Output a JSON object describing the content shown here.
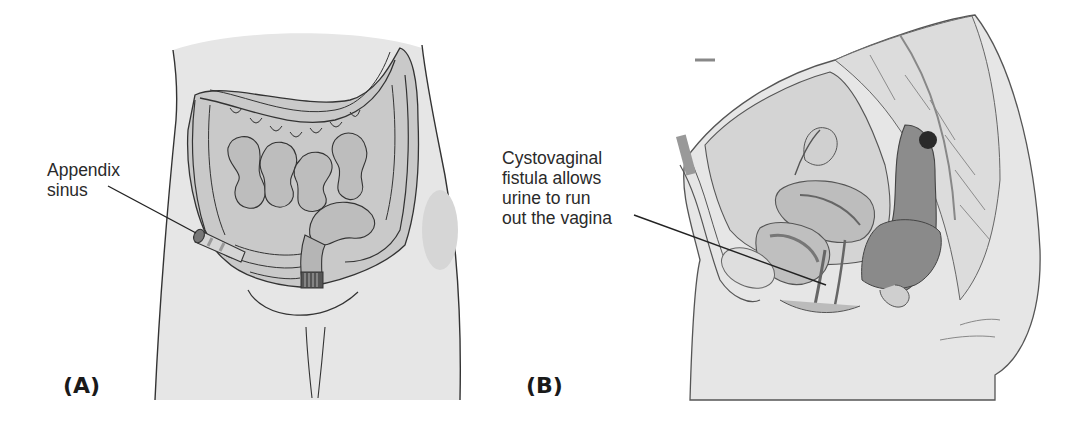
{
  "figure": {
    "panels": [
      {
        "id": "A",
        "tag": "(A)",
        "callout": {
          "lines": [
            "Appendix",
            "sinus"
          ]
        },
        "subject": "anterior abdomen with colon and small intestine"
      },
      {
        "id": "B",
        "tag": "(B)",
        "callout": {
          "lines": [
            "Cystovaginal",
            "fistula allows",
            "urine to run",
            "out the vagina"
          ]
        },
        "subject": "female pelvis sagittal section"
      }
    ]
  },
  "colors": {
    "body_fill": "#e6e6e6",
    "organ_fill": "#bdbdbd",
    "organ_dark": "#8c8c8c",
    "outline": "#333333",
    "text": "#2a2a2a"
  }
}
